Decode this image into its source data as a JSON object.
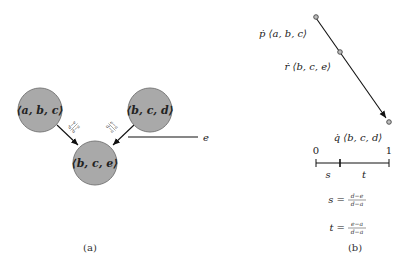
{
  "panel_a": {
    "caption": "(a)",
    "nodes": [
      {
        "id": "abc",
        "label": "⟨a, b, c⟩"
      },
      {
        "id": "bcd",
        "label": "⟨b, c, d⟩"
      },
      {
        "id": "bce",
        "label": "⟨b, c, e⟩"
      }
    ],
    "edges": [
      {
        "from": "abc",
        "to": "bce",
        "label_num": "d−e",
        "label_den": "d−a"
      },
      {
        "from": "bcd",
        "to": "bce",
        "label_num": "e−a",
        "label_den": "d−a"
      }
    ],
    "cut_line_label": "e",
    "node_fill": "#a9a9a9",
    "node_stroke": "#777777"
  },
  "panel_b": {
    "caption": "(b)",
    "points": [
      {
        "id": "p",
        "label": "ṗ ⟨a, b, c⟩"
      },
      {
        "id": "r",
        "label": "ṙ ⟨b, c, e⟩"
      },
      {
        "id": "q",
        "label": "q̇ ⟨b, c, d⟩"
      }
    ],
    "number_line": {
      "start_label": "0",
      "end_label": "1",
      "segment_s": "s",
      "segment_t": "t"
    },
    "formulas": [
      {
        "lhs": "s =",
        "num": "d−e",
        "den": "d−a"
      },
      {
        "lhs": "t =",
        "num": "e−a",
        "den": "d−a"
      }
    ]
  }
}
